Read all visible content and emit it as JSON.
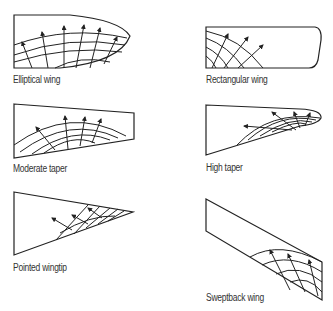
{
  "diagram": {
    "colors": {
      "line": "#222222",
      "text": "#333333",
      "background": "#ffffff"
    },
    "panels": [
      {
        "id": "elliptical",
        "label": "Elliptical wing"
      },
      {
        "id": "rectangular",
        "label": "Rectangular wing"
      },
      {
        "id": "moderate-taper",
        "label": "Moderate taper"
      },
      {
        "id": "high-taper",
        "label": "High taper"
      },
      {
        "id": "pointed-wingtip",
        "label": "Pointed wingtip"
      },
      {
        "id": "sweptback",
        "label": "Sweptback wing"
      }
    ]
  }
}
